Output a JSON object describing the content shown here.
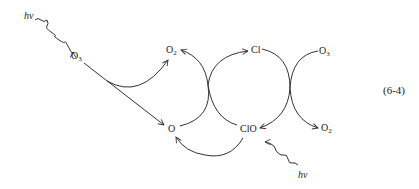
{
  "diagram": {
    "equation_number": "(6-4)",
    "species": {
      "o3_left": {
        "base": "O",
        "sub": "3"
      },
      "o2_top": {
        "base": "O",
        "sub": "2"
      },
      "cl": {
        "base": "Cl",
        "sub": ""
      },
      "o3_right": {
        "base": "O",
        "sub": "3"
      },
      "o_bottom": {
        "base": "O",
        "sub": ""
      },
      "clo": {
        "base": "ClO",
        "sub": ""
      },
      "o2_right": {
        "base": "O",
        "sub": "2"
      }
    },
    "photon_top": "hν",
    "photon_bottom": "hν",
    "colors": {
      "stroke": "#333333",
      "background": "#ffffff"
    }
  }
}
